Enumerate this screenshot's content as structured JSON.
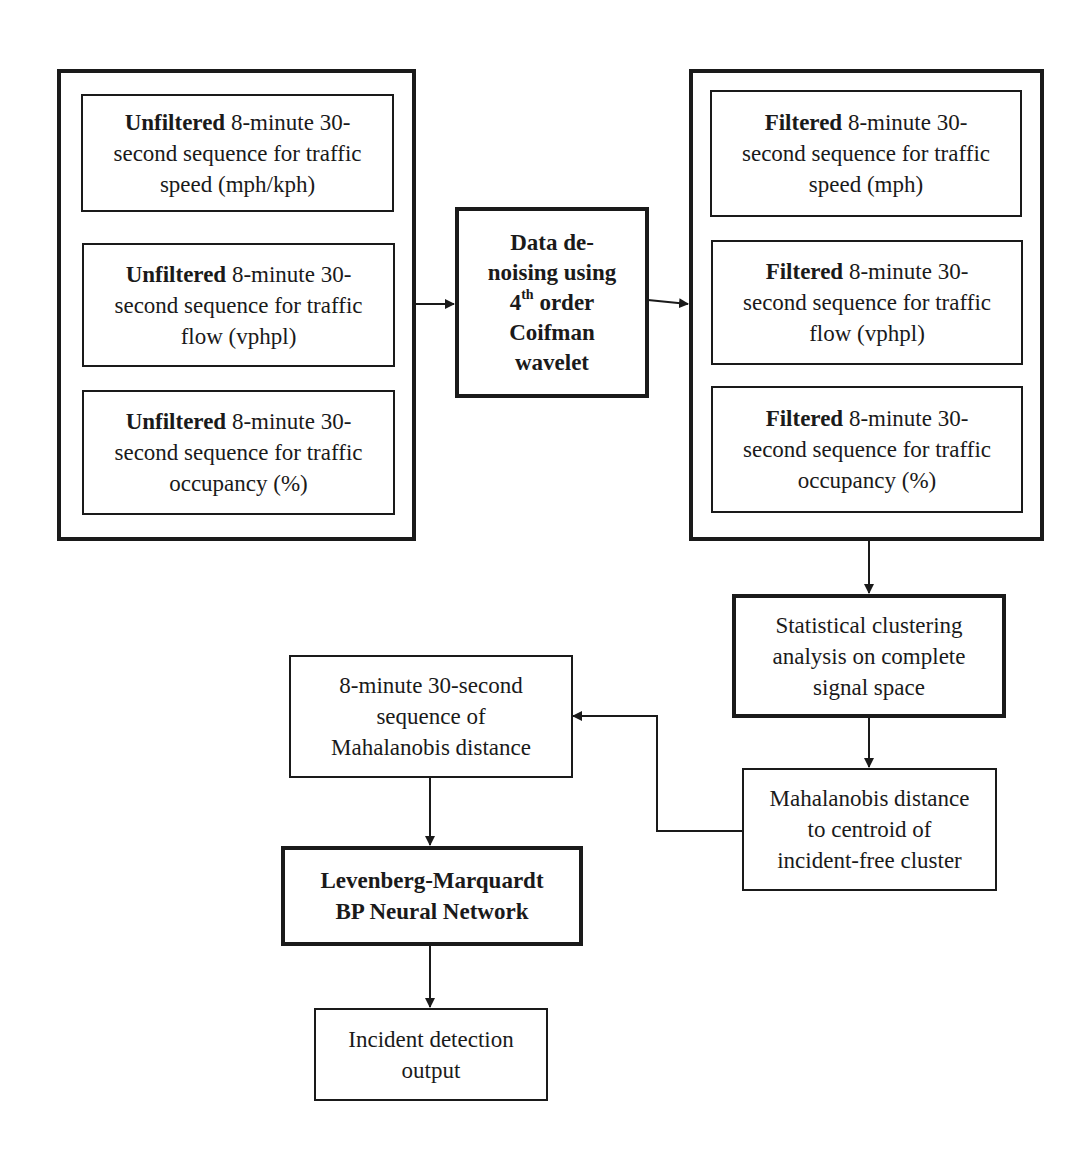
{
  "diagram": {
    "unfiltered_group": {
      "items": [
        {
          "bold": "Unfiltered",
          "line1_rest": " 8-minute 30-",
          "line2": "second sequence for traffic",
          "line3": "speed (mph/kph)"
        },
        {
          "bold": "Unfiltered",
          "line1_rest": " 8-minute 30-",
          "line2": "second sequence for traffic",
          "line3": "flow (vphpl)"
        },
        {
          "bold": "Unfiltered",
          "line1_rest": " 8-minute 30-",
          "line2": "second sequence for traffic",
          "line3": "occupancy (%)"
        }
      ]
    },
    "denoising": {
      "line1": "Data de-",
      "line2": "noising using",
      "line3_num": "4",
      "line3_sup": "th",
      "line3_rest": " order",
      "line4": "Coifman",
      "line5": "wavelet"
    },
    "filtered_group": {
      "items": [
        {
          "bold": "Filtered",
          "line1_rest": " 8-minute 30-",
          "line2": "second sequence for traffic",
          "line3": "speed (mph)"
        },
        {
          "bold": "Filtered",
          "line1_rest": " 8-minute 30-",
          "line2": "second sequence for traffic",
          "line3": "flow (vphpl)"
        },
        {
          "bold": "Filtered",
          "line1_rest": " 8-minute 30-",
          "line2": "second sequence for traffic",
          "line3": "occupancy (%)"
        }
      ]
    },
    "clustering": {
      "line1": "Statistical clustering",
      "line2": "analysis on complete",
      "line3": "signal space"
    },
    "mahalanobis_centroid": {
      "line1": "Mahalanobis distance",
      "line2": "to centroid of",
      "line3": "incident-free cluster"
    },
    "mahalanobis_sequence": {
      "line1": "8-minute 30-second",
      "line2": "sequence of",
      "line3": "Mahalanobis distance"
    },
    "neural_network": {
      "line1": "Levenberg-Marquardt",
      "line2": "BP Neural Network"
    },
    "output": {
      "line1": "Incident detection",
      "line2": "output"
    },
    "colors": {
      "stroke": "#1a1a1a",
      "background": "#ffffff"
    }
  }
}
